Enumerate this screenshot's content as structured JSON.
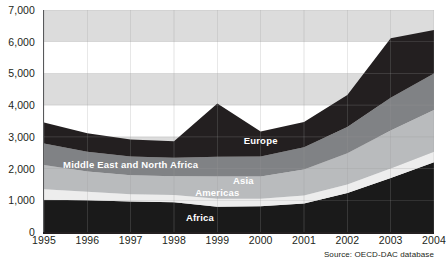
{
  "top_cut_text": "",
  "source_note": "Source: OECD-DAC database",
  "chart_data": {
    "type": "area",
    "stacked": true,
    "title": "",
    "subtitle": "",
    "xlabel": "",
    "ylabel": "",
    "categories": [
      "1995",
      "1996",
      "1997",
      "1998",
      "1999",
      "2000",
      "2001",
      "2002",
      "2003",
      "2004"
    ],
    "x": [
      1995,
      1996,
      1997,
      1998,
      1999,
      2000,
      2001,
      2002,
      2003,
      2004
    ],
    "ylim": [
      0,
      7000
    ],
    "yticks": [
      0,
      1000,
      2000,
      3000,
      4000,
      5000,
      6000,
      7000
    ],
    "ytick_labels": [
      "0",
      "1,000",
      "2,000",
      "3,000",
      "4,000",
      "5,000",
      "6,000",
      "7,000"
    ],
    "grid": "horizontal-bands",
    "legend": "in-chart-labels",
    "series": [
      {
        "name": "Africa",
        "color": "#1a1a1a",
        "values": [
          1020,
          1000,
          960,
          940,
          800,
          810,
          900,
          1230,
          1700,
          2200
        ]
      },
      {
        "name": "Americas",
        "color": "#ededed",
        "values": [
          330,
          270,
          230,
          230,
          250,
          240,
          250,
          270,
          300,
          330
        ]
      },
      {
        "name": "Asia",
        "color": "#b9bbbd",
        "values": [
          760,
          640,
          600,
          590,
          700,
          700,
          820,
          980,
          1200,
          1320
        ]
      },
      {
        "name": "Middle East and North Africa",
        "color": "#808285",
        "values": [
          680,
          620,
          590,
          580,
          620,
          630,
          700,
          830,
          1030,
          1150
        ]
      },
      {
        "name": "Europe",
        "color": "#231f20",
        "values": [
          660,
          580,
          540,
          520,
          1680,
          790,
          800,
          1010,
          1880,
          1370
        ]
      }
    ],
    "totals": [
      3450,
      3110,
      2920,
      2860,
      4050,
      3170,
      3470,
      4320,
      6110,
      6370
    ],
    "series_label_positions": [
      {
        "name": "Europe",
        "x_year": 2000.0,
        "y_value": 2880
      },
      {
        "name": "Middle East and North Africa",
        "x_year": 1997.0,
        "y_value": 2100
      },
      {
        "name": "Asia",
        "x_year": 1999.6,
        "y_value": 1600
      },
      {
        "name": "Americas",
        "x_year": 1999.0,
        "y_value": 1220
      },
      {
        "name": "Africa",
        "x_year": 1998.6,
        "y_value": 450
      }
    ],
    "band_shading": {
      "band_color": "#dcdcdc",
      "shaded_ranges": [
        [
          6000,
          7000
        ],
        [
          4000,
          5000
        ],
        [
          2000,
          3000
        ],
        [
          0,
          1000
        ]
      ]
    }
  }
}
